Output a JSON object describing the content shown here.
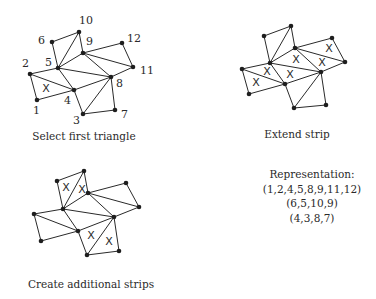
{
  "figure": {
    "panels": [
      {
        "id": "select-first-triangle",
        "caption": "Select first triangle",
        "caption_pos": [
          84,
          140
        ],
        "vertices": {
          "1": [
            37,
            100
          ],
          "2": [
            30,
            74
          ],
          "3": [
            83,
            114
          ],
          "4": [
            74,
            90
          ],
          "5": [
            58,
            68
          ],
          "6": [
            52,
            42
          ],
          "7": [
            115,
            110
          ],
          "8": [
            111,
            77
          ],
          "9": [
            83,
            53
          ],
          "10": [
            79,
            32
          ],
          "11": [
            133,
            67
          ],
          "12": [
            122,
            43
          ]
        },
        "labels": {
          "1": [
            33,
            114
          ],
          "2": [
            22,
            67
          ],
          "3": [
            73,
            124
          ],
          "4": [
            64,
            104
          ],
          "5": [
            45,
            66
          ],
          "6": [
            38,
            44
          ],
          "7": [
            121,
            118
          ],
          "8": [
            116,
            87
          ],
          "9": [
            86,
            45
          ],
          "10": [
            79,
            24
          ],
          "11": [
            140,
            74
          ],
          "12": [
            127,
            42
          ]
        },
        "x_marks": [
          [
            46,
            88
          ]
        ]
      },
      {
        "id": "extend-strip",
        "caption": "Extend strip",
        "caption_pos": [
          297,
          138
        ],
        "vertices": {
          "1": [
            249,
            94
          ],
          "2": [
            242,
            69
          ],
          "3": [
            294,
            108
          ],
          "4": [
            285,
            84
          ],
          "5": [
            270,
            63
          ],
          "6": [
            264,
            36
          ],
          "7": [
            326,
            105
          ],
          "8": [
            321,
            72
          ],
          "9": [
            295,
            48
          ],
          "10": [
            291,
            26
          ],
          "11": [
            345,
            62
          ],
          "12": [
            332,
            38
          ]
        },
        "x_marks": [
          [
            256,
            82
          ],
          [
            267,
            71
          ],
          [
            290,
            74
          ],
          [
            296,
            59
          ],
          [
            322,
            62
          ],
          [
            329,
            48
          ]
        ]
      },
      {
        "id": "create-additional-strips",
        "caption": "Create additional strips",
        "caption_pos": [
          91,
          288
        ],
        "vertices": {
          "1": [
            41,
            241
          ],
          "2": [
            34,
            214
          ],
          "3": [
            87,
            255
          ],
          "4": [
            78,
            231
          ],
          "5": [
            63,
            209
          ],
          "6": [
            57,
            181
          ],
          "7": [
            119,
            251
          ],
          "8": [
            114,
            217
          ],
          "9": [
            88,
            193
          ],
          "10": [
            84,
            171
          ],
          "11": [
            139,
            207
          ],
          "12": [
            126,
            183
          ]
        },
        "x_marks": [
          [
            66,
            187
          ],
          [
            82,
            189
          ],
          [
            91,
            235
          ],
          [
            109,
            241
          ]
        ]
      }
    ],
    "edges": [
      [
        "1",
        "2"
      ],
      [
        "1",
        "4"
      ],
      [
        "2",
        "4"
      ],
      [
        "2",
        "5"
      ],
      [
        "4",
        "5"
      ],
      [
        "4",
        "8"
      ],
      [
        "5",
        "8"
      ],
      [
        "5",
        "9"
      ],
      [
        "8",
        "9"
      ],
      [
        "8",
        "11"
      ],
      [
        "9",
        "11"
      ],
      [
        "9",
        "12"
      ],
      [
        "11",
        "12"
      ],
      [
        "5",
        "6"
      ],
      [
        "6",
        "10"
      ],
      [
        "5",
        "10"
      ],
      [
        "9",
        "10"
      ],
      [
        "3",
        "4"
      ],
      [
        "3",
        "8"
      ],
      [
        "3",
        "7"
      ],
      [
        "7",
        "8"
      ]
    ],
    "representation": {
      "title": "Representation:",
      "strips": [
        "(1,2,4,5,8,9,11,12)",
        "(6,5,10,9)",
        "(4,3,8,7)"
      ],
      "center_x": 312,
      "line_y": [
        178,
        193,
        207,
        222
      ]
    },
    "x_glyph": "X"
  }
}
